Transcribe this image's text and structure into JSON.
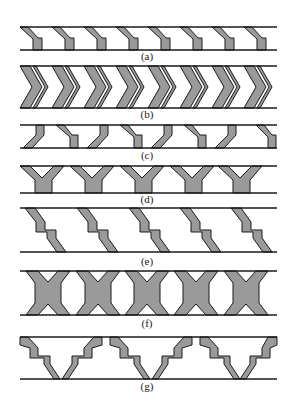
{
  "figure": {
    "colors": {
      "cell_fill": "#9a9a9a",
      "outline": "#1a1a1a",
      "background": "#ffffff"
    },
    "panels": [
      {
        "id": "a",
        "label": "(a)",
        "shape": "slanted-bent-strut",
        "repeat": 8
      },
      {
        "id": "b",
        "label": "(b)",
        "shape": "chevron-re-entrant",
        "repeat": 8
      },
      {
        "id": "c",
        "label": "(c)",
        "shape": "alternating-bent-strut",
        "repeat": 8
      },
      {
        "id": "d",
        "label": "(d)",
        "shape": "y-branch",
        "repeat": 5
      },
      {
        "id": "e",
        "label": "(e)",
        "shape": "stepped-diagonal-strut",
        "repeat": 5
      },
      {
        "id": "f",
        "label": "(f)",
        "shape": "x-cross-hexagonal",
        "repeat": 5
      },
      {
        "id": "g",
        "label": "(g)",
        "shape": "stepped-v-arch",
        "repeat": 3
      }
    ]
  }
}
